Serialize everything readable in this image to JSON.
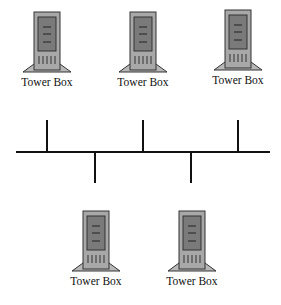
{
  "diagram": {
    "type": "bus-network",
    "nodes": [
      {
        "id": "top-1",
        "label": "Tower Box",
        "icon": "tower-computer-icon",
        "position": "above-bus"
      },
      {
        "id": "top-2",
        "label": "Tower Box",
        "icon": "tower-computer-icon",
        "position": "above-bus"
      },
      {
        "id": "top-3",
        "label": "Tower Box",
        "icon": "tower-computer-icon",
        "position": "above-bus"
      },
      {
        "id": "bottom-1",
        "label": "Tower Box",
        "icon": "tower-computer-icon",
        "position": "below-bus"
      },
      {
        "id": "bottom-2",
        "label": "Tower Box",
        "icon": "tower-computer-icon",
        "position": "below-bus"
      }
    ],
    "bus": {
      "color": "#111111"
    },
    "colors": {
      "case": "#a8a8a8",
      "panel": "#7a7a7a",
      "outline": "#333333"
    }
  }
}
